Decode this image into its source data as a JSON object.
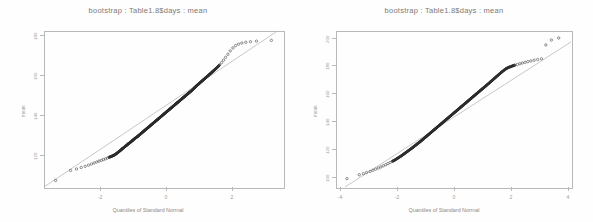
{
  "figure": {
    "background": "#fefefe",
    "panel_count": 2,
    "axis_color": "#b9b9b9",
    "point_color": "#2a2a2a",
    "refline_color": "#b0b0b0"
  },
  "chart_data": [
    {
      "type": "scatter",
      "subtype": "qq-plot",
      "title": "bootstrap : Table1.8$days : mean",
      "xlabel": "Quantiles of Standard Normal",
      "ylabel": "mean",
      "xlim": [
        -3.6,
        3.6
      ],
      "ylim": [
        103,
        186
      ],
      "xticks": [
        -2,
        0,
        2
      ],
      "xticklabels": [
        "-2",
        "0",
        "2"
      ],
      "yticks": [
        120,
        140,
        160,
        180
      ],
      "yticklabels": [
        "120",
        "140",
        "160",
        "180"
      ],
      "grid": false,
      "legend": null,
      "reference_line": {
        "intercept": 145.5,
        "slope": 11.8
      },
      "x": [
        -3.25,
        -2.8,
        -2.62,
        -2.48,
        -2.36,
        -2.26,
        -2.17,
        -2.09,
        -2.01,
        -1.94,
        -1.87,
        -1.81,
        -1.75,
        -1.69,
        -1.64,
        -1.58,
        -1.53,
        -1.48,
        -1.43,
        -1.38,
        -1.33,
        -1.28,
        -1.24,
        -1.19,
        -1.15,
        -1.1,
        -1.06,
        -1.01,
        -0.97,
        -0.93,
        -0.89,
        -0.85,
        -0.8,
        -0.76,
        -0.72,
        -0.68,
        -0.64,
        -0.6,
        -0.56,
        -0.52,
        -0.48,
        -0.44,
        -0.4,
        -0.36,
        -0.32,
        -0.28,
        -0.24,
        -0.2,
        -0.16,
        -0.12,
        -0.08,
        -0.04,
        0.0,
        0.04,
        0.08,
        0.12,
        0.16,
        0.2,
        0.24,
        0.28,
        0.32,
        0.36,
        0.4,
        0.44,
        0.48,
        0.52,
        0.56,
        0.6,
        0.64,
        0.68,
        0.72,
        0.76,
        0.8,
        0.85,
        0.89,
        0.93,
        0.97,
        1.01,
        1.06,
        1.1,
        1.15,
        1.19,
        1.24,
        1.28,
        1.33,
        1.38,
        1.43,
        1.48,
        1.53,
        1.58,
        1.64,
        1.69,
        1.75,
        1.81,
        1.87,
        1.94,
        2.01,
        2.09,
        2.17,
        2.26,
        2.36,
        2.48,
        2.62,
        2.8,
        3.25
      ],
      "y": [
        106.5,
        111.8,
        112.6,
        113.4,
        114.0,
        114.6,
        115.2,
        115.8,
        116.3,
        116.8,
        117.2,
        117.6,
        118.0,
        118.4,
        118.8,
        119.2,
        119.6,
        120.0,
        120.6,
        121.3,
        122.0,
        122.7,
        123.4,
        124.0,
        124.7,
        125.3,
        126.0,
        126.6,
        127.2,
        127.8,
        128.4,
        129.0,
        129.6,
        130.2,
        130.8,
        131.4,
        132.0,
        132.6,
        133.2,
        133.8,
        134.4,
        135.0,
        135.6,
        136.2,
        136.8,
        137.4,
        138.0,
        138.6,
        139.2,
        139.8,
        140.4,
        141.0,
        141.6,
        142.2,
        142.8,
        143.4,
        144.0,
        144.6,
        145.2,
        145.8,
        146.4,
        147.0,
        147.6,
        148.2,
        148.8,
        149.4,
        150.0,
        150.6,
        151.2,
        151.8,
        152.4,
        153.0,
        153.6,
        154.3,
        155.0,
        155.7,
        156.4,
        157.1,
        157.8,
        158.5,
        159.2,
        159.9,
        160.6,
        161.3,
        162.0,
        162.8,
        163.6,
        164.4,
        165.2,
        166.0,
        167.0,
        168.0,
        169.2,
        170.5,
        172.0,
        173.6,
        175.4,
        177.0,
        178.2,
        179.0,
        179.6,
        180.0,
        180.3,
        180.6,
        181.0
      ]
    },
    {
      "type": "scatter",
      "subtype": "qq-plot",
      "title": "bootstrap : Table1.8$days : mean",
      "xlabel": "Quantiles of Standard Normal",
      "ylabel": "mean",
      "xlim": [
        -4.3,
        4.3
      ],
      "ylim": [
        96,
        208
      ],
      "xticks": [
        -4,
        -2,
        0,
        2,
        4
      ],
      "xticklabels": [
        "-4",
        "-2",
        "0",
        "2",
        "4"
      ],
      "yticks": [
        100,
        120,
        140,
        160,
        180,
        200
      ],
      "yticklabels": [
        "100",
        "120",
        "140",
        "160",
        "180",
        "200"
      ],
      "grid": false,
      "legend": null,
      "reference_line": {
        "intercept": 146.0,
        "slope": 12.6
      },
      "x": [
        -3.9,
        -3.45,
        -3.3,
        -3.18,
        -3.05,
        -2.95,
        -2.85,
        -2.75,
        -2.66,
        -2.57,
        -2.48,
        -2.4,
        -2.32,
        -2.24,
        -2.16,
        -2.08,
        -2.0,
        -1.92,
        -1.85,
        -1.78,
        -1.71,
        -1.64,
        -1.57,
        -1.5,
        -1.44,
        -1.37,
        -1.31,
        -1.24,
        -1.18,
        -1.12,
        -1.06,
        -1.0,
        -0.94,
        -0.88,
        -0.82,
        -0.76,
        -0.7,
        -0.64,
        -0.58,
        -0.52,
        -0.46,
        -0.4,
        -0.34,
        -0.28,
        -0.22,
        -0.16,
        -0.1,
        -0.04,
        0.02,
        0.08,
        0.14,
        0.2,
        0.26,
        0.32,
        0.38,
        0.44,
        0.5,
        0.56,
        0.62,
        0.68,
        0.74,
        0.8,
        0.86,
        0.92,
        0.98,
        1.04,
        1.1,
        1.17,
        1.23,
        1.3,
        1.36,
        1.43,
        1.5,
        1.57,
        1.64,
        1.71,
        1.78,
        1.86,
        1.93,
        2.01,
        2.09,
        2.17,
        2.25,
        2.34,
        2.43,
        2.52,
        2.62,
        2.72,
        2.83,
        2.95,
        3.08,
        3.22,
        3.38,
        3.58,
        3.85
      ],
      "y": [
        102.0,
        104.8,
        105.6,
        106.4,
        107.2,
        108.0,
        108.8,
        109.6,
        110.4,
        111.2,
        112.0,
        112.8,
        113.6,
        114.4,
        115.2,
        116.2,
        117.2,
        118.2,
        119.2,
        120.2,
        121.2,
        122.2,
        123.2,
        124.2,
        125.2,
        126.2,
        127.2,
        128.2,
        129.2,
        130.2,
        131.2,
        132.2,
        133.2,
        134.2,
        135.2,
        136.2,
        137.2,
        138.2,
        139.2,
        140.2,
        141.2,
        142.2,
        143.2,
        144.2,
        145.2,
        146.2,
        147.2,
        148.2,
        149.2,
        150.2,
        151.2,
        152.2,
        153.2,
        154.2,
        155.2,
        156.2,
        157.2,
        158.2,
        159.2,
        160.2,
        161.2,
        162.2,
        163.2,
        164.2,
        165.2,
        166.2,
        167.2,
        168.3,
        169.4,
        170.5,
        171.6,
        172.8,
        174.0,
        175.2,
        176.4,
        177.6,
        178.8,
        180.0,
        181.0,
        181.8,
        182.4,
        183.0,
        183.5,
        184.0,
        184.5,
        185.0,
        185.5,
        186.0,
        186.5,
        187.0,
        187.5,
        188.0,
        198.0,
        201.5,
        203.0
      ]
    }
  ]
}
